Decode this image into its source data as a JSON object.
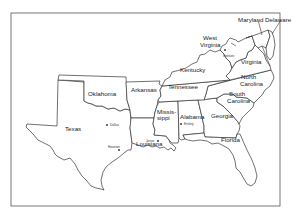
{
  "map": {
    "title": "",
    "states": [
      {
        "name": "Maryland",
        "label": "Maryland"
      },
      {
        "name": "Delaware",
        "label": "Delaware"
      },
      {
        "name": "West Virginia",
        "label_line1": "West",
        "label_line2": "Virginia"
      },
      {
        "name": "Virginia",
        "label": "Virginia"
      },
      {
        "name": "Kentucky",
        "label": "Kentucky"
      },
      {
        "name": "North Carolina",
        "label_line1": "North",
        "label_line2": "Carolina"
      },
      {
        "name": "Tennessee",
        "label": "Tennessee"
      },
      {
        "name": "Oklahoma",
        "label": "Oklahoma"
      },
      {
        "name": "Arkansas",
        "label": "Arkansas"
      },
      {
        "name": "South Carolina",
        "label_line1": "South",
        "label_line2": "Carolina"
      },
      {
        "name": "Mississippi",
        "label_line1": "Missis-",
        "label_line2": "sippi"
      },
      {
        "name": "Alabama",
        "label": "Alabama"
      },
      {
        "name": "Georgia",
        "label": "Georgia"
      },
      {
        "name": "Texas",
        "label": "Texas"
      },
      {
        "name": "Louisiana",
        "label": "Louisiana"
      },
      {
        "name": "Florida",
        "label": "Florida"
      }
    ],
    "cities": [
      {
        "name": "Institute",
        "state": "West Virginia"
      },
      {
        "name": "Dallas",
        "state": "Texas"
      },
      {
        "name": "Houston",
        "state": "Texas"
      },
      {
        "name": "Jesse",
        "state": "Louisiana"
      },
      {
        "name": "Ensley",
        "state": "Alabama"
      }
    ],
    "colors": {
      "background": "#ffffff",
      "stroke": "#333333",
      "text": "#222222"
    }
  }
}
